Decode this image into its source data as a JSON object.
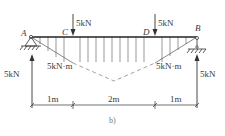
{
  "diagram": {
    "caption": "b)",
    "points": {
      "A": "A",
      "B": "B",
      "C": "C",
      "D": "D"
    },
    "loads": {
      "C": "5kN",
      "D": "5kN"
    },
    "reactions": {
      "A": "5kN",
      "B": "5kN"
    },
    "moments": {
      "C": "5kN·m",
      "D": "5kN·m"
    },
    "dimensions": [
      "1m",
      "2m",
      "1m"
    ],
    "colors": {
      "line": "#3a3a3a",
      "dashed": "#7a7a7a"
    }
  }
}
